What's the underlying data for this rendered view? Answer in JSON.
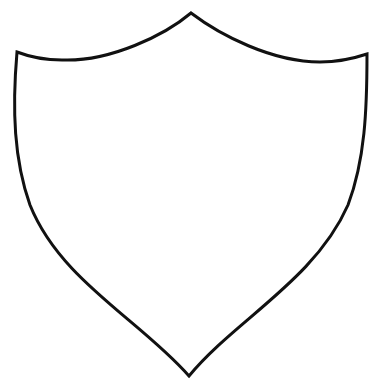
{
  "figure": {
    "stroke_color": "#111111",
    "fill_color": "#ffffff",
    "background_color": "#ffffff"
  }
}
